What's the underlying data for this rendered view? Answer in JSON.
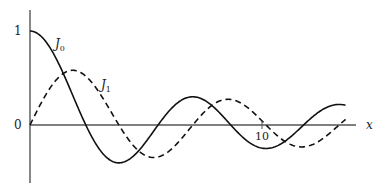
{
  "chart_data": {
    "type": "line",
    "title": "",
    "xlabel": "x",
    "ylabel": "",
    "xlim": [
      0,
      13.7
    ],
    "ylim": [
      -0.55,
      1.2
    ],
    "x_ticks": [
      {
        "value": 10,
        "label": "10"
      }
    ],
    "y_ticks": [
      {
        "value": 1,
        "label": "1"
      },
      {
        "value": 0,
        "label": "0"
      }
    ],
    "grid": false,
    "legend": "inline labels",
    "series": [
      {
        "name": "J0",
        "label_main": "J",
        "label_sub": "0",
        "style": "solid",
        "function": "Bessel J0(x)",
        "x_range": [
          0,
          13.6
        ],
        "color": "#111111"
      },
      {
        "name": "J1",
        "label_main": "J",
        "label_sub": "1",
        "style": "dashed",
        "function": "Bessel J1(x)",
        "x_range": [
          0,
          13.6
        ],
        "color": "#111111"
      }
    ],
    "annotations": [
      {
        "text": "J0",
        "near_x": 1.2,
        "near_y": 0.85
      },
      {
        "text": "J1",
        "near_x": 3.2,
        "near_y": 0.4
      }
    ]
  }
}
